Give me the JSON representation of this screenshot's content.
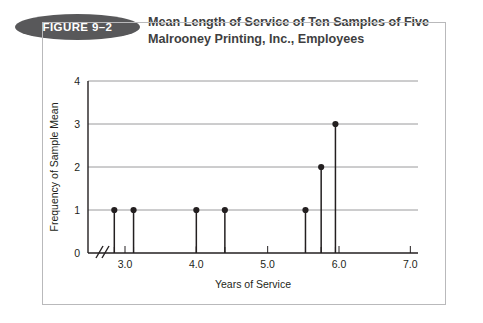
{
  "figure": {
    "badge_label": "FIGURE 9–2",
    "title_line1": "Mean Length of Service of Ten Samples of Five",
    "title_line2": "Malrooney Printing, Inc., Employees"
  },
  "colors": {
    "badge_fill": "#58585a",
    "title_text": "#3f3f41",
    "axis": "#231f20",
    "gridline": "#9a9a9c",
    "frame": "#b9b9bb",
    "background": "#ffffff"
  },
  "chart_data": {
    "type": "scatter",
    "title": "Mean Length of Service of Ten Samples of Five Malrooney Printing, Inc., Employees",
    "xlabel": "Years of Service",
    "ylabel": "Frequency of Sample Mean",
    "xlim": [
      2.65,
      7.2
    ],
    "ylim": [
      0,
      4
    ],
    "xticks": [
      3.0,
      4.0,
      5.0,
      6.0,
      7.0
    ],
    "xtick_labels": [
      "3.0",
      "4.0",
      "5.0",
      "6.0",
      "7.0"
    ],
    "yticks": [
      0,
      1,
      2,
      3,
      4
    ],
    "ytick_labels": [
      "0",
      "1",
      "2",
      "3",
      "4"
    ],
    "grid": "horizontal",
    "axis_break": true,
    "axis_break_note": "x-axis broken between 0 and 2.8",
    "legend": null,
    "x": [
      2.85,
      3.12,
      4.0,
      4.4,
      5.53,
      5.75,
      5.95
    ],
    "y": [
      1,
      1,
      1,
      1,
      1,
      2,
      3
    ],
    "total_samples": 10,
    "points": [
      {
        "x": 2.85,
        "y": 1
      },
      {
        "x": 3.12,
        "y": 1
      },
      {
        "x": 4.0,
        "y": 1
      },
      {
        "x": 4.4,
        "y": 1
      },
      {
        "x": 5.53,
        "y": 1
      },
      {
        "x": 5.75,
        "y": 2
      },
      {
        "x": 5.95,
        "y": 3
      }
    ]
  }
}
